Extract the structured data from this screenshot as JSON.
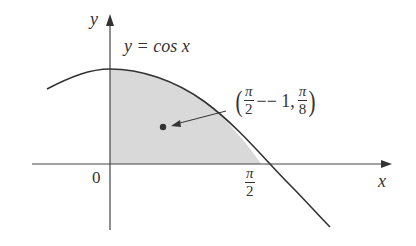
{
  "figure": {
    "y_axis_label": "y",
    "x_axis_label": "x",
    "origin_label": "0",
    "curve_label": "y = cos x",
    "x_tick": {
      "numerator": "π",
      "denominator": "2"
    },
    "point_label": {
      "open": "(",
      "x_num": "π",
      "x_den": "2",
      "x_minus": "−− 1,",
      "y_num": "π",
      "y_den": "8",
      "close": ")"
    }
  },
  "colors": {
    "shade": "#d9d9d9",
    "line": "#333333"
  }
}
